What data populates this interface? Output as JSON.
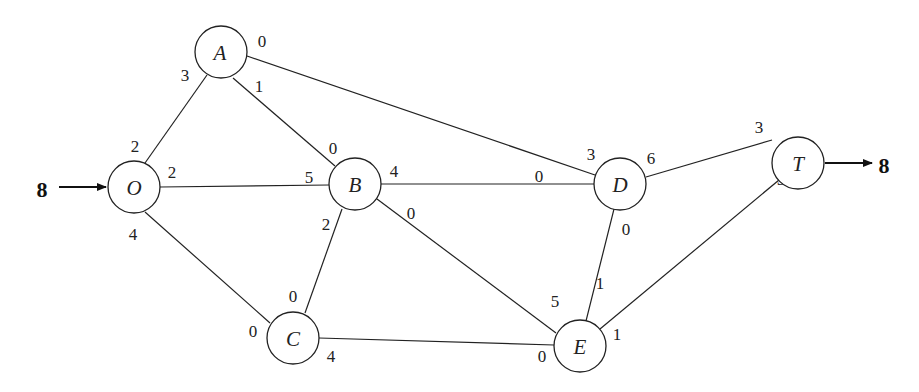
{
  "diagram": {
    "type": "flow-network",
    "source_flow": "8",
    "sink_flow": "8",
    "nodes": [
      {
        "id": "O",
        "label": "O",
        "x": 134,
        "y": 187
      },
      {
        "id": "A",
        "label": "A",
        "x": 221,
        "y": 52
      },
      {
        "id": "B",
        "label": "B",
        "x": 355,
        "y": 184
      },
      {
        "id": "C",
        "label": "C",
        "x": 293,
        "y": 338
      },
      {
        "id": "D",
        "label": "D",
        "x": 620,
        "y": 184
      },
      {
        "id": "E",
        "label": "E",
        "x": 580,
        "y": 346
      },
      {
        "id": "T",
        "label": "T",
        "x": 798,
        "y": 163
      }
    ],
    "edges": [
      {
        "from": "O",
        "to": "A",
        "cap_from": "2",
        "cap_to": "3"
      },
      {
        "from": "O",
        "to": "B",
        "cap_from": "2",
        "cap_to": "5"
      },
      {
        "from": "O",
        "to": "C",
        "cap_from": "4",
        "cap_to": "0"
      },
      {
        "from": "A",
        "to": "B",
        "cap_from": "1",
        "cap_to": "0"
      },
      {
        "from": "A",
        "to": "D",
        "cap_from": "0",
        "cap_to": "3"
      },
      {
        "from": "B",
        "to": "C",
        "cap_from": "2",
        "cap_to": "0"
      },
      {
        "from": "B",
        "to": "D",
        "cap_from": "4",
        "cap_to": "0"
      },
      {
        "from": "B",
        "to": "E",
        "cap_from": "0",
        "cap_to": "5"
      },
      {
        "from": "C",
        "to": "E",
        "cap_from": "4",
        "cap_to": "0"
      },
      {
        "from": "D",
        "to": "E",
        "cap_from": "0",
        "cap_to": "1"
      },
      {
        "from": "D",
        "to": "T",
        "cap_from": "6",
        "cap_to": "3"
      },
      {
        "from": "E",
        "to": "T",
        "cap_from": "1",
        "cap_to": "5"
      }
    ]
  }
}
